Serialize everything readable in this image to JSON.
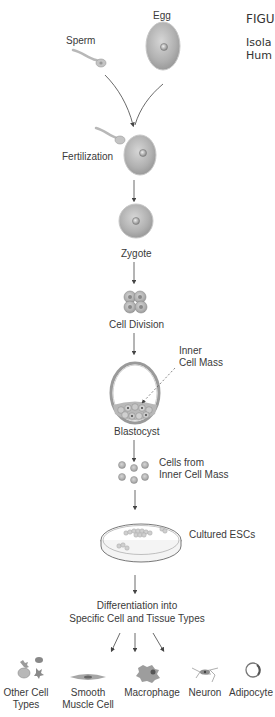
{
  "figure": {
    "label": "FIGU",
    "caption_lines": [
      "Isola",
      "Hum"
    ]
  },
  "stages": {
    "egg": "Egg",
    "sperm": "Sperm",
    "fertilization": "Fertilization",
    "zygote": "Zygote",
    "cell_division": "Cell Division",
    "inner_cell_mass_line1": "Inner",
    "inner_cell_mass_line2": "Cell Mass",
    "blastocyst": "Blastocyst",
    "cells_from_icm_line1": "Cells from",
    "cells_from_icm_line2": "Inner Cell Mass",
    "cultured_escs": "Cultured ESCs",
    "differentiation_line1": "Differentiation into",
    "differentiation_line2": "Specific Cell and Tissue Types"
  },
  "cell_types": [
    {
      "line1": "Other Cell",
      "line2": "Types"
    },
    {
      "line1": "Smooth",
      "line2": "Muscle Cell"
    },
    {
      "line1": "Macrophage",
      "line2": ""
    },
    {
      "line1": "Neuron",
      "line2": ""
    },
    {
      "line1": "Adipocyte",
      "line2": ""
    }
  ],
  "colors": {
    "cell_fill": "#b5b5b5",
    "cell_edge": "#8c8c8c",
    "line": "#444444",
    "text": "#3a3a3a"
  }
}
